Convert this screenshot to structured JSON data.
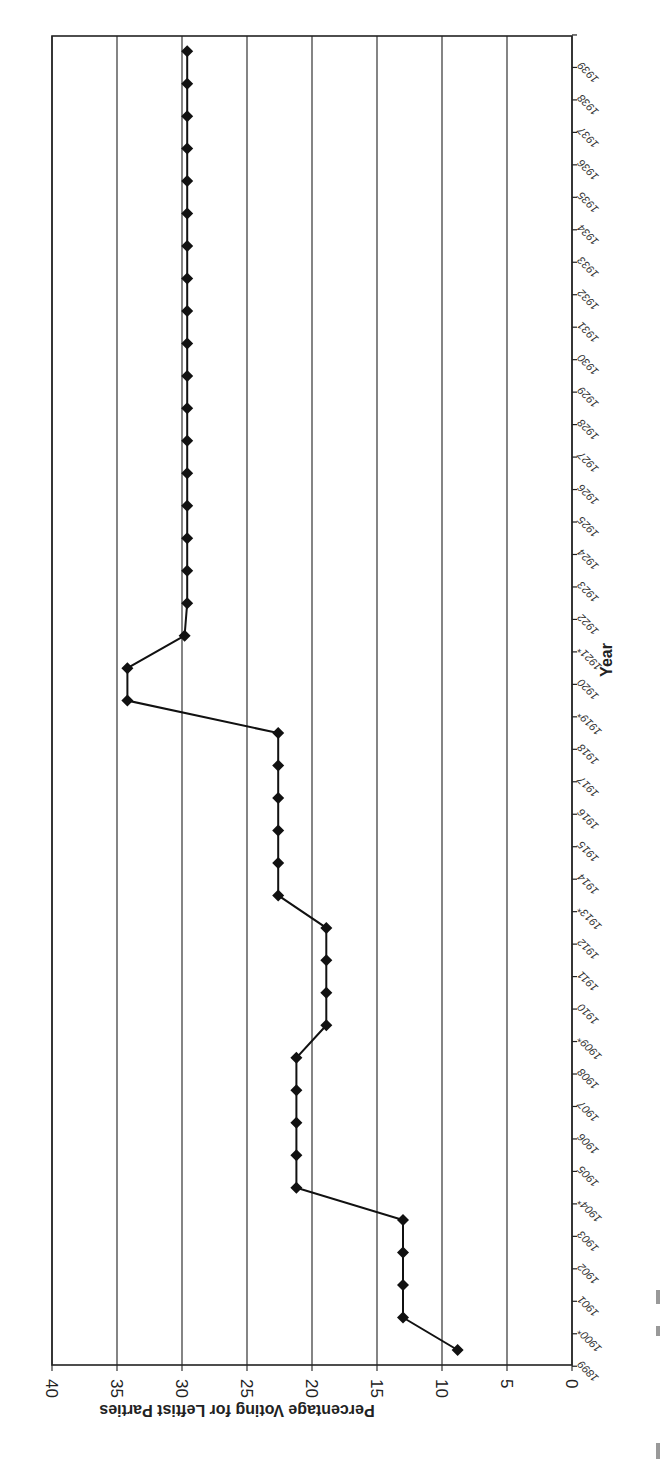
{
  "chart_data": {
    "type": "line",
    "title": "",
    "xlabel": "Year",
    "ylabel": "Percentage Voting for Leftist Parties",
    "orientation_note": "figure rotated 180 degrees (axes drawn upside-down / page rotated)",
    "ylim": [
      0,
      40
    ],
    "yticks": [
      0,
      5,
      10,
      15,
      20,
      25,
      30,
      35,
      40
    ],
    "grid": true,
    "legend": null,
    "marker": "diamond",
    "categories": [
      "1899",
      "1900*",
      "1901",
      "1902",
      "1903",
      "1904*",
      "1905",
      "1906",
      "1907",
      "1908",
      "1909*",
      "1910",
      "1911",
      "1912",
      "1913*",
      "1914",
      "1915",
      "1916",
      "1917",
      "1918",
      "1919*",
      "1920",
      "1921*",
      "1922",
      "1923",
      "1924",
      "1925",
      "1926",
      "1927",
      "1928",
      "1929",
      "1930",
      "1931",
      "1932",
      "1933",
      "1934",
      "1935",
      "1936",
      "1937",
      "1938",
      "1939"
    ],
    "series": [
      {
        "name": "Percentage Voting for Leftist Parties",
        "values": [
          8.8,
          13.0,
          13.0,
          13.0,
          13.0,
          21.2,
          21.2,
          21.2,
          21.2,
          21.2,
          18.9,
          18.9,
          18.9,
          18.9,
          22.6,
          22.6,
          22.6,
          22.6,
          22.6,
          22.6,
          34.2,
          34.2,
          29.8,
          29.6,
          29.6,
          29.6,
          29.6,
          29.6,
          29.6,
          29.6,
          29.6,
          29.6,
          29.6,
          29.6,
          29.6,
          29.6,
          29.6,
          29.6,
          29.6,
          29.6,
          29.6
        ]
      }
    ]
  },
  "layout": {
    "x_of_zero": 572,
    "px_per_unit": 13,
    "top": 36,
    "bottom": 1365,
    "first_point_y": 1350,
    "step_y": 32.47
  }
}
